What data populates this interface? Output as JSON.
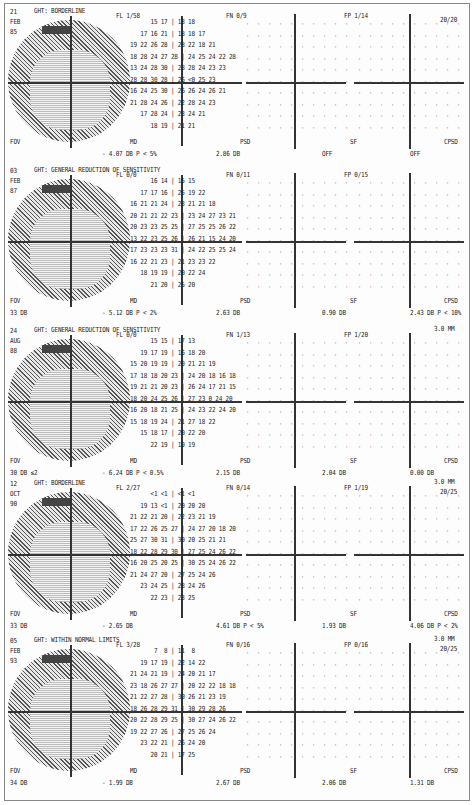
{
  "panels": [
    {
      "date": [
        "21",
        "FEB",
        "85"
      ],
      "ght": "GHT: BORDERLINE",
      "fl": "FL 1/58",
      "fn": "FN 0/9",
      "fp": "FP 1/14",
      "fov": "FOV",
      "fov_value": "",
      "md_label": "MD",
      "md": "- 4.07 DB   P <  5%",
      "psd_label": "PSD",
      "psd": "2.86 DB",
      "sf_label": "SF",
      "sf": "OFF",
      "cpsd_label": "CPSD",
      "cpsd": "OFF",
      "pupil": "",
      "acuity": "20/20",
      "grid_rows": [
        "      15 17 | 18 18      ",
        "   17 16 21 | 18 18 17   ",
        "19 22 26 28 | 28 22 18 21",
        "18 28 24 27 28 | 24 25 24 22 28",
        "13 24 28 30 | 28 28 24 23 23",
        "28 28 30 28 | 26 <0 25 23",
        "16 24 25 30 | 26 26 24 26 21",
        "21 28 24 26 | 22 28 24 23",
        "   17 28 24 | 23 24 21",
        "      18 19 | 21 21"
      ]
    },
    {
      "date": [
        "03",
        "FEB",
        "87"
      ],
      "ght": "GHT: GENERAL REDUCTION OF SENSITIVITY",
      "fl": "FL 0/0",
      "fn": "FN 0/11",
      "fp": "FP 0/15",
      "fov": "FOV",
      "fov_value": "33 DB",
      "md_label": "MD",
      "md": "- 5.12 DB   P <  2%",
      "psd_label": "PSD",
      "psd": "2.63 DB",
      "sf_label": "SF",
      "sf": "0.90 DB",
      "cpsd_label": "CPSD",
      "cpsd": "2.43 DB   P < 10%",
      "pupil": "",
      "acuity": "",
      "grid_rows": [
        "      16 14 | 15 15",
        "   17 17 16 | 25 19 22",
        "16 21 21 24 | 23 21 21 18",
        "20 21 21 22 23 | 23 24 27 23 21",
        "20 23 23 25 25 | 27 25 25 26 22",
        "13 22 23 25 26 | 26 21 15 24 20",
        "17 23 23 23 31 | 24 22 25 25 24",
        "16 22 21 23 | 21 23 23 22",
        "   18 19 19 | 20 22 24",
        "      21 20 | 25 20"
      ]
    },
    {
      "date": [
        "24",
        "AUG",
        "88"
      ],
      "ght": "GHT: GENERAL REDUCTION OF SENSITIVITY",
      "fl": "FL 0/0",
      "fn": "FN 1/13",
      "fp": "FP 1/20",
      "fov": "FOV",
      "fov_value": "30 DB ≤2",
      "md_label": "MD",
      "md": "- 6.24 DB   P < 0.5%",
      "psd_label": "PSD",
      "psd": "2.15 DB",
      "sf_label": "SF",
      "sf": "2.04 DB",
      "cpsd_label": "CPSD",
      "cpsd": "0.00 DB",
      "pupil": "3.0 MM",
      "acuity": "",
      "grid_rows": [
        "      15 15 | 17 13",
        "   19 17 19 | 16 18 20",
        "15 20 19 19 | 20 21 21 19",
        "17 18 18 20 23 | 24 20 18 16 18",
        "19 21 21 20 23 | 26 24 17 21 15",
        "18 20 24 25 26 | 27 23 0 24 20",
        "16 20 18 21 25 | 24 23 22 24 20",
        "15 18 19 24 | 21 27 18 22",
        "   15 18 17 | 20 22 20",
        "      22 19 | 19 19"
      ]
    },
    {
      "date": [
        "12",
        "OCT",
        "90"
      ],
      "ght": "GHT: BORDERLINE",
      "fl": "FL 2/27",
      "fn": "FN 0/14",
      "fp": "FP 1/19",
      "fov": "FOV",
      "fov_value": "33 DB",
      "md_label": "MD",
      "md": "- 2.65 DB",
      "psd_label": "PSD",
      "psd": "4.61 DB   P <  5%",
      "sf_label": "SF",
      "sf": "1.93 DB",
      "cpsd_label": "CPSD",
      "cpsd": "4.06 DB   P <  2%",
      "pupil": "3.0 MM",
      "acuity": "20/25",
      "grid_rows": [
        "      <1 <1 | <1 <1",
        "   19 13 <1 | 20 20 20",
        "21 22 21 20 | 22 23 21 19",
        "17 22 26 25 27 | 24 27 20 18 20",
        "25 27 30 31 | 30 20 25 21 21",
        "18 22 28 29 30 | 27 25 24 26 22",
        "16 20 25 20 25 | 30 25 24 26 22",
        "21 24 27 20 | 27 25 24 26",
        "   23 24 25 | 28 24 26",
        "      22 23 | 23 25"
      ]
    },
    {
      "date": [
        "05",
        "FEB",
        "93"
      ],
      "ght": "GHT: WITHIN NORMAL LIMITS",
      "fl": "FL 3/28",
      "fn": "FN 0/16",
      "fp": "FP 0/16",
      "fov": "FOV",
      "fov_value": "34 DB",
      "md_label": "MD",
      "md": "- 1.99 DB",
      "psd_label": "PSD",
      "psd": "2.67 DB",
      "sf_label": "SF",
      "sf": "2.06 DB",
      "cpsd_label": "CPSD",
      "cpsd": "1.31 DB",
      "pupil": "3.0 MM",
      "acuity": "20/25",
      "grid_rows": [
        "       7  8 | 11  8",
        "   19 17 19 | 22 14 22",
        "21 24 21 19 | 24 20 21 17",
        "23 18 26 27 27 | 20 22 22 18 18",
        "21 22 27 28 | 30 26 21 23 19",
        "18 26 28 29 31 | 30 29 28 26",
        "20 22 28 29 25 | 30 27 24 26 22",
        "19 22 27 26 | 27 25 26 24",
        "   23 22 21 | 26 24 20",
        "      20 21 | 17 25"
      ]
    }
  ]
}
